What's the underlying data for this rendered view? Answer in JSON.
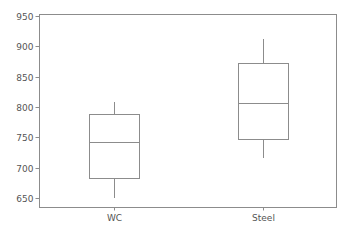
{
  "chart_data": {
    "type": "box",
    "title": "",
    "xlabel": "",
    "ylabel": "",
    "categories": [
      "WC",
      "Steel"
    ],
    "series": [
      {
        "name": "WC",
        "whisker_low": 650,
        "q1": 683,
        "median": 742,
        "q3": 789,
        "whisker_high": 808
      },
      {
        "name": "Steel",
        "whisker_low": 716,
        "q1": 747,
        "median": 806,
        "q3": 872,
        "whisker_high": 912
      }
    ],
    "ylim": [
      635,
      955
    ],
    "yticks": [
      650,
      700,
      750,
      800,
      850,
      900,
      950
    ],
    "grid": false,
    "legend": "none"
  },
  "colors": {
    "axis": "#8c8c8c",
    "box": "#8c8c8c",
    "text": "#555555",
    "background": "#ffffff"
  },
  "ytick_labels": [
    "650",
    "700",
    "750",
    "800",
    "850",
    "900",
    "950"
  ],
  "xtick_labels": [
    "WC",
    "Steel"
  ]
}
